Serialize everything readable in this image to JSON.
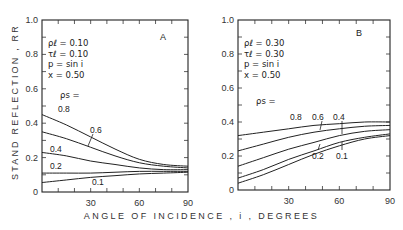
{
  "figure": {
    "ylabel": "STAND REFLECTION , RR",
    "xlabel": "ANGLE OF INCIDENCE , i , DEGREES"
  },
  "chart_data": [
    {
      "type": "line",
      "panel": "A",
      "title": "A",
      "parameters": [
        "ρℓ = 0.10",
        "τℓ = 0.10",
        "p = sin i",
        "x = 0.50"
      ],
      "legend_title": "ρs =",
      "xlabel": "ANGLE OF INCIDENCE , i , DEGREES",
      "ylabel": "STAND REFLECTION , RR",
      "xlim": [
        0,
        90
      ],
      "ylim": [
        0,
        1.0
      ],
      "xticks": [
        30,
        60,
        90
      ],
      "yticks": [
        0,
        0.2,
        0.4,
        0.6,
        0.8,
        1.0
      ],
      "ytick_labels": [
        "0",
        "0.2",
        "0.4",
        "0.6",
        "0.8",
        "1.0"
      ],
      "grid": false,
      "x": [
        0,
        15,
        30,
        45,
        60,
        75,
        90
      ],
      "series": [
        {
          "name": "0.8",
          "values": [
            0.45,
            0.39,
            0.32,
            0.25,
            0.19,
            0.16,
            0.15
          ]
        },
        {
          "name": "0.6",
          "values": [
            0.35,
            0.31,
            0.26,
            0.21,
            0.17,
            0.15,
            0.14
          ]
        },
        {
          "name": "0.4",
          "values": [
            0.23,
            0.21,
            0.18,
            0.16,
            0.14,
            0.13,
            0.13
          ]
        },
        {
          "name": "0.2",
          "values": [
            0.11,
            0.11,
            0.11,
            0.115,
            0.12,
            0.12,
            0.12
          ]
        },
        {
          "name": "0.1",
          "values": [
            0.055,
            0.07,
            0.085,
            0.095,
            0.105,
            0.11,
            0.115
          ]
        }
      ]
    },
    {
      "type": "line",
      "panel": "B",
      "title": "B",
      "parameters": [
        "ρℓ = 0.30",
        "τℓ = 0.30",
        "p = sin i",
        "x = 0.50"
      ],
      "legend_title": "ρs =",
      "xlabel": "ANGLE OF INCIDENCE , i , DEGREES",
      "ylabel": "STAND REFLECTION , RR",
      "xlim": [
        0,
        90
      ],
      "ylim": [
        0,
        1.0
      ],
      "xticks": [
        30,
        60,
        90
      ],
      "yticks": [
        0,
        0.2,
        0.4,
        0.6,
        0.8,
        1.0
      ],
      "ytick_labels": [
        "0",
        "0.2",
        "0.4",
        "0.6",
        "0.8",
        "1.0"
      ],
      "grid": false,
      "x": [
        0,
        15,
        30,
        45,
        60,
        75,
        90
      ],
      "series": [
        {
          "name": "0.8",
          "values": [
            0.32,
            0.34,
            0.36,
            0.38,
            0.39,
            0.4,
            0.4
          ]
        },
        {
          "name": "0.6",
          "values": [
            0.23,
            0.27,
            0.31,
            0.34,
            0.36,
            0.375,
            0.38
          ]
        },
        {
          "name": "0.4",
          "values": [
            0.14,
            0.19,
            0.24,
            0.28,
            0.32,
            0.345,
            0.355
          ]
        },
        {
          "name": "0.2",
          "values": [
            0.07,
            0.12,
            0.18,
            0.23,
            0.28,
            0.31,
            0.33
          ]
        },
        {
          "name": "0.1",
          "values": [
            0.04,
            0.09,
            0.15,
            0.21,
            0.26,
            0.3,
            0.32
          ]
        }
      ]
    }
  ]
}
